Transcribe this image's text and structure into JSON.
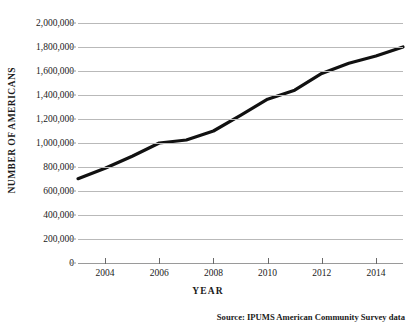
{
  "chart_data": {
    "type": "line",
    "title": "",
    "xlabel": "YEAR",
    "ylabel": "NUMBER OF AMERICANS",
    "xlim": [
      2003,
      2015
    ],
    "ylim": [
      0,
      2000000
    ],
    "grid": true,
    "legend": null,
    "x_tick_labels": [
      "2004",
      "2006",
      "2008",
      "2010",
      "2012",
      "2014"
    ],
    "x_tick_values": [
      2004,
      2006,
      2008,
      2010,
      2012,
      2014
    ],
    "y_tick_labels": [
      "0",
      "200,000",
      "400,000",
      "600,000",
      "800,000",
      "1,000,000",
      "1,200,000",
      "1,400,000",
      "1,600,000",
      "1,800,000",
      "2,000,000"
    ],
    "y_tick_values": [
      0,
      200000,
      400000,
      600000,
      800000,
      1000000,
      1200000,
      1400000,
      1600000,
      1800000,
      2000000
    ],
    "x": [
      2003,
      2004,
      2005,
      2006,
      2007,
      2008,
      2009,
      2010,
      2011,
      2012,
      2013,
      2014,
      2015
    ],
    "values": [
      703000,
      790000,
      890000,
      1000000,
      1025000,
      1100000,
      1230000,
      1365000,
      1440000,
      1580000,
      1665000,
      1725000,
      1800000
    ],
    "series": [
      {
        "name": "Number of Americans",
        "color": "#111111",
        "values": [
          703000,
          790000,
          890000,
          1000000,
          1025000,
          1100000,
          1230000,
          1365000,
          1440000,
          1580000,
          1665000,
          1725000,
          1800000
        ]
      }
    ],
    "annotations": [
      "Source:  IPUMS American Community Survey data"
    ]
  },
  "axes": {
    "y_title": "NUMBER OF AMERICANS",
    "x_title": "YEAR"
  },
  "caption": {
    "source": "Source:  IPUMS American Community Survey data"
  },
  "colors": {
    "line": "#111111",
    "grid": "#b9b9b9",
    "axis": "#9a9a9a",
    "text": "#1a1a1a",
    "background": "#ffffff"
  }
}
